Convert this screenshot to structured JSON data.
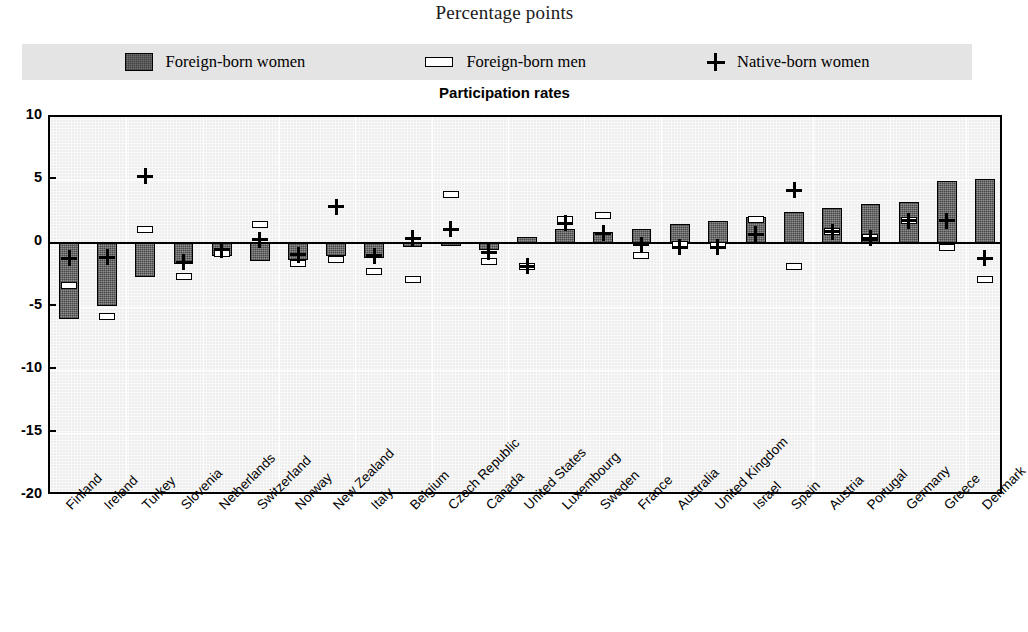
{
  "header": {
    "unit_label": "Percentage points"
  },
  "legend": {
    "items": [
      {
        "label": "Foreign-born women",
        "marker": "filled-square-swatch"
      },
      {
        "label": "Foreign-born men",
        "marker": "dash-swatch"
      },
      {
        "label": "Native-born women",
        "marker": "plus-swatch"
      }
    ]
  },
  "colors": {
    "bar_fill": "#737373",
    "plot_background": "#eeeeee",
    "legend_background": "#e4e4e4",
    "axis": "#000000",
    "gridline": "#ffffff"
  },
  "chart_data": {
    "type": "bar",
    "title": "Participation rates",
    "subtitle": "Percentage points",
    "xlabel": "",
    "ylabel": "Percentage points",
    "ylim": [
      -20,
      10
    ],
    "yticks": [
      10,
      5,
      0,
      -5,
      -10,
      -15,
      -20
    ],
    "grid": true,
    "legend_position": "top",
    "categories": [
      "Finland",
      "Ireland",
      "Turkey",
      "Slovenia",
      "Netherlands",
      "Switzerland",
      "Norway",
      "New Zealand",
      "Italy",
      "Belgium",
      "Czech Republic",
      "Canada",
      "United States",
      "Luxembourg",
      "Sweden",
      "France",
      "Australia",
      "United Kingdom",
      "Israel",
      "Spain",
      "Austria",
      "Portugal",
      "Germany",
      "Greece",
      "Denmark"
    ],
    "series": [
      {
        "name": "Foreign-born women",
        "type": "bar",
        "values": [
          -6.0,
          -5.0,
          -2.7,
          -1.6,
          -1.0,
          -1.4,
          -1.3,
          -1.0,
          -1.2,
          -0.3,
          -0.2,
          -0.5,
          0.5,
          1.1,
          0.9,
          1.1,
          1.5,
          1.8,
          2.1,
          2.5,
          2.8,
          3.1,
          3.3,
          4.9,
          5.1
        ]
      },
      {
        "name": "Foreign-born men",
        "type": "dash",
        "values": [
          -3.3,
          -5.8,
          1.1,
          -2.6,
          -0.8,
          1.5,
          -1.6,
          -1.3,
          -2.2,
          -2.9,
          3.9,
          -1.4,
          -1.8,
          1.9,
          2.2,
          -1.0,
          -0.1,
          -0.2,
          1.9,
          -1.8,
          0.9,
          0.5,
          1.8,
          -0.3,
          -2.9
        ]
      },
      {
        "name": "Native-born women",
        "type": "plus",
        "values": [
          -1.2,
          -1.1,
          5.3,
          -1.5,
          -0.5,
          0.3,
          -0.9,
          2.9,
          -1.0,
          0.4,
          1.1,
          -0.7,
          -1.8,
          1.6,
          0.8,
          -0.1,
          -0.3,
          -0.3,
          0.7,
          4.2,
          0.9,
          0.4,
          1.8,
          1.8,
          -1.2
        ]
      }
    ]
  }
}
